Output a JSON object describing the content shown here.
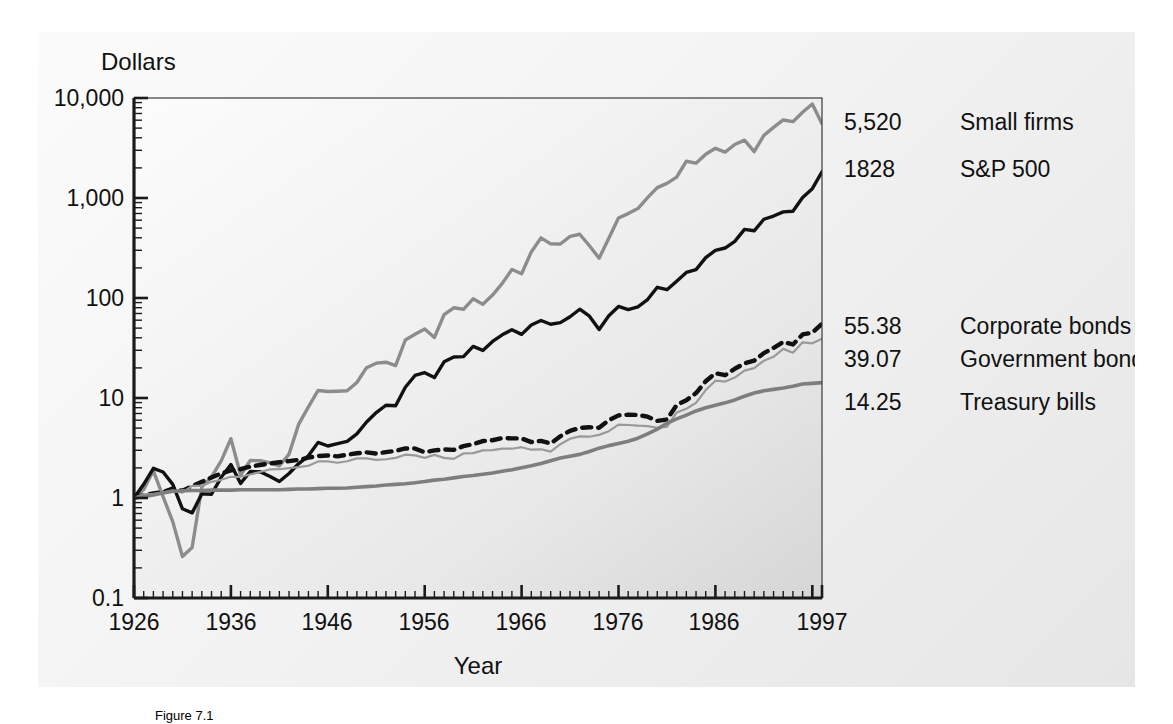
{
  "figure": {
    "caption": "Figure 7.1",
    "axis_titles": {
      "y": "Dollars",
      "x": "Year"
    }
  },
  "chart_data": {
    "type": "line",
    "title": "",
    "xlabel": "Year",
    "ylabel": "Dollars",
    "yscale": "log",
    "ylim": [
      0.1,
      10000
    ],
    "ytick_labels": [
      "10,000",
      "1,000",
      "100",
      "10",
      "1",
      "0.1"
    ],
    "ytick_values": [
      10000,
      1000,
      100,
      10,
      1,
      0.1
    ],
    "xlim": [
      1926,
      1997
    ],
    "xtick_labels": [
      "1926",
      "1936",
      "1946",
      "1956",
      "1966",
      "1976",
      "1986",
      "1997"
    ],
    "xtick_values": [
      1926,
      1936,
      1946,
      1956,
      1966,
      1976,
      1986,
      1997
    ],
    "grid": false,
    "legend_position": "right-of-plot",
    "x": [
      1926,
      1927,
      1928,
      1929,
      1930,
      1931,
      1932,
      1933,
      1934,
      1935,
      1936,
      1937,
      1938,
      1939,
      1940,
      1941,
      1942,
      1943,
      1944,
      1945,
      1946,
      1947,
      1948,
      1949,
      1950,
      1951,
      1952,
      1953,
      1954,
      1955,
      1956,
      1957,
      1958,
      1959,
      1960,
      1961,
      1962,
      1963,
      1964,
      1965,
      1966,
      1967,
      1968,
      1969,
      1970,
      1971,
      1972,
      1973,
      1974,
      1975,
      1976,
      1977,
      1978,
      1979,
      1980,
      1981,
      1982,
      1983,
      1984,
      1985,
      1986,
      1987,
      1988,
      1989,
      1990,
      1991,
      1992,
      1993,
      1994,
      1995,
      1996,
      1997
    ],
    "series": [
      {
        "name": "Small firms",
        "end_value": "5,520",
        "color": "#8c8c8c",
        "style": "solid",
        "width": 3.4,
        "values": [
          1.0,
          1.22,
          1.87,
          1.03,
          0.58,
          0.26,
          0.32,
          1.29,
          1.63,
          2.35,
          3.92,
          1.7,
          2.37,
          2.36,
          2.26,
          2.09,
          2.75,
          5.48,
          8.16,
          11.9,
          11.6,
          11.7,
          11.8,
          14.3,
          20.1,
          22.3,
          22.8,
          21.1,
          38.0,
          43.4,
          48.9,
          40.3,
          68.2,
          79.8,
          77.1,
          98.2,
          86.4,
          107,
          140,
          193,
          175,
          289,
          399,
          348,
          347,
          413,
          434,
          333,
          250,
          395,
          630,
          698,
          785,
          1010,
          1270,
          1400,
          1620,
          2330,
          2230,
          2740,
          3140,
          2880,
          3430,
          3790,
          2910,
          4230,
          5090,
          6030,
          5800,
          7200,
          8700,
          5520
        ]
      },
      {
        "name": "S&P 500",
        "end_value": "1828",
        "color": "#111111",
        "style": "solid",
        "width": 3.4,
        "values": [
          1.0,
          1.37,
          1.98,
          1.82,
          1.37,
          0.78,
          0.71,
          1.1,
          1.09,
          1.61,
          2.16,
          1.4,
          1.84,
          1.83,
          1.65,
          1.46,
          1.76,
          2.21,
          2.64,
          3.6,
          3.31,
          3.5,
          3.69,
          4.38,
          5.76,
          7.15,
          8.46,
          8.38,
          12.8,
          16.8,
          17.9,
          16.0,
          23.0,
          25.7,
          25.9,
          32.8,
          29.9,
          36.8,
          42.8,
          48.2,
          43.3,
          53.7,
          59.6,
          54.6,
          56.7,
          64.9,
          77.2,
          65.8,
          48.4,
          66.4,
          82.3,
          76.5,
          81.5,
          96.5,
          128,
          121,
          147,
          180,
          192,
          253,
          300,
          316,
          368,
          485,
          470,
          613,
          660,
          726,
          736,
          1010,
          1240,
          1828
        ]
      },
      {
        "name": "Corporate bonds",
        "end_value": "55.38",
        "color": "#111111",
        "style": "dashed",
        "width": 4.4,
        "values": [
          1.0,
          1.07,
          1.11,
          1.15,
          1.24,
          1.18,
          1.31,
          1.45,
          1.6,
          1.76,
          1.89,
          1.94,
          2.06,
          2.14,
          2.21,
          2.28,
          2.34,
          2.41,
          2.53,
          2.63,
          2.66,
          2.61,
          2.71,
          2.8,
          2.86,
          2.78,
          2.88,
          2.96,
          3.13,
          3.12,
          2.87,
          2.99,
          3.06,
          3.03,
          3.3,
          3.45,
          3.71,
          3.78,
          3.98,
          3.95,
          3.94,
          3.62,
          3.73,
          3.51,
          4.14,
          4.7,
          5.03,
          5.1,
          5.04,
          6.0,
          6.7,
          6.8,
          6.78,
          6.5,
          5.9,
          6.1,
          8.5,
          9.5,
          11.2,
          14.7,
          17.7,
          16.9,
          19.6,
          22.2,
          23.6,
          28.1,
          31.7,
          36.4,
          34.3,
          43.2,
          45.0,
          55.38
        ]
      },
      {
        "name": "Government bonds",
        "end_value": "39.07",
        "color": "#9a9a9a",
        "style": "solid",
        "width": 2.2,
        "values": [
          1.0,
          1.09,
          1.1,
          1.14,
          1.19,
          1.13,
          1.32,
          1.32,
          1.45,
          1.52,
          1.63,
          1.63,
          1.72,
          1.82,
          1.93,
          1.94,
          1.99,
          2.04,
          2.1,
          2.32,
          2.32,
          2.25,
          2.33,
          2.49,
          2.49,
          2.41,
          2.44,
          2.52,
          2.71,
          2.67,
          2.52,
          2.7,
          2.52,
          2.46,
          2.79,
          2.81,
          2.99,
          3.01,
          3.12,
          3.11,
          3.22,
          3.04,
          3.07,
          2.91,
          3.45,
          3.91,
          4.13,
          4.1,
          4.28,
          4.66,
          5.42,
          5.37,
          5.29,
          5.24,
          5.04,
          5.14,
          7.17,
          7.81,
          8.94,
          12.0,
          14.9,
          14.6,
          16.0,
          18.8,
          19.9,
          23.6,
          25.8,
          31.0,
          28.4,
          36.0,
          35.2,
          39.07
        ]
      },
      {
        "name": "Treasury bills",
        "end_value": "14.25",
        "color": "#7e7e7e",
        "style": "solid",
        "width": 3.6,
        "values": [
          1.0,
          1.03,
          1.07,
          1.12,
          1.17,
          1.18,
          1.19,
          1.19,
          1.2,
          1.2,
          1.2,
          1.21,
          1.21,
          1.21,
          1.21,
          1.21,
          1.22,
          1.23,
          1.23,
          1.24,
          1.25,
          1.25,
          1.26,
          1.28,
          1.3,
          1.32,
          1.35,
          1.37,
          1.39,
          1.42,
          1.46,
          1.51,
          1.54,
          1.59,
          1.64,
          1.68,
          1.73,
          1.78,
          1.85,
          1.92,
          2.01,
          2.1,
          2.21,
          2.36,
          2.51,
          2.62,
          2.73,
          2.92,
          3.15,
          3.34,
          3.51,
          3.69,
          3.96,
          4.38,
          4.88,
          5.59,
          6.19,
          6.74,
          7.42,
          7.99,
          8.48,
          8.94,
          9.57,
          10.4,
          11.2,
          11.8,
          12.2,
          12.6,
          13.1,
          13.8,
          14.0,
          14.25
        ]
      }
    ]
  },
  "legend": [
    {
      "value": "5,520",
      "label": "Small firms"
    },
    {
      "value": "1828",
      "label": "S&P 500"
    },
    {
      "value": "55.38",
      "label": "Corporate bonds"
    },
    {
      "value": "39.07",
      "label": "Government bonds"
    },
    {
      "value": "14.25",
      "label": "Treasury bills"
    }
  ]
}
